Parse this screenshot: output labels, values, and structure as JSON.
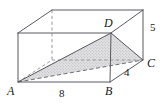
{
  "figure": {
    "kind": "geometry-diagram",
    "stroke_color": "#5a5a62",
    "hidden_stroke_color": "#8b8b93",
    "shade_fill": "#d8d8da",
    "background": "#ffffff",
    "vertices": [
      {
        "name": "A",
        "label": "A",
        "x": 18,
        "y": 82
      },
      {
        "name": "B",
        "label": "B",
        "x": 110,
        "y": 82
      },
      {
        "name": "C",
        "label": "C",
        "x": 143,
        "y": 60
      },
      {
        "name": "D",
        "label": "D",
        "x": 111,
        "y": 33
      },
      {
        "name": "back-bottom-left",
        "label": "",
        "x": 52,
        "y": 60
      },
      {
        "name": "front-top-left",
        "label": "",
        "x": 18,
        "y": 33
      },
      {
        "name": "back-top-left",
        "label": "",
        "x": 52,
        "y": 10
      },
      {
        "name": "back-top-right",
        "label": "",
        "x": 143,
        "y": 10
      }
    ],
    "measurements": [
      {
        "name": "edge-AB",
        "value": "8",
        "x": 59,
        "y": 88
      },
      {
        "name": "edge-BC",
        "value": "4",
        "x": 124,
        "y": 67
      },
      {
        "name": "edge-vertical-right",
        "value": "5",
        "x": 150,
        "y": 22
      }
    ],
    "vertex_labels": {
      "A": "A",
      "B": "B",
      "C": "C",
      "D": "D"
    }
  }
}
